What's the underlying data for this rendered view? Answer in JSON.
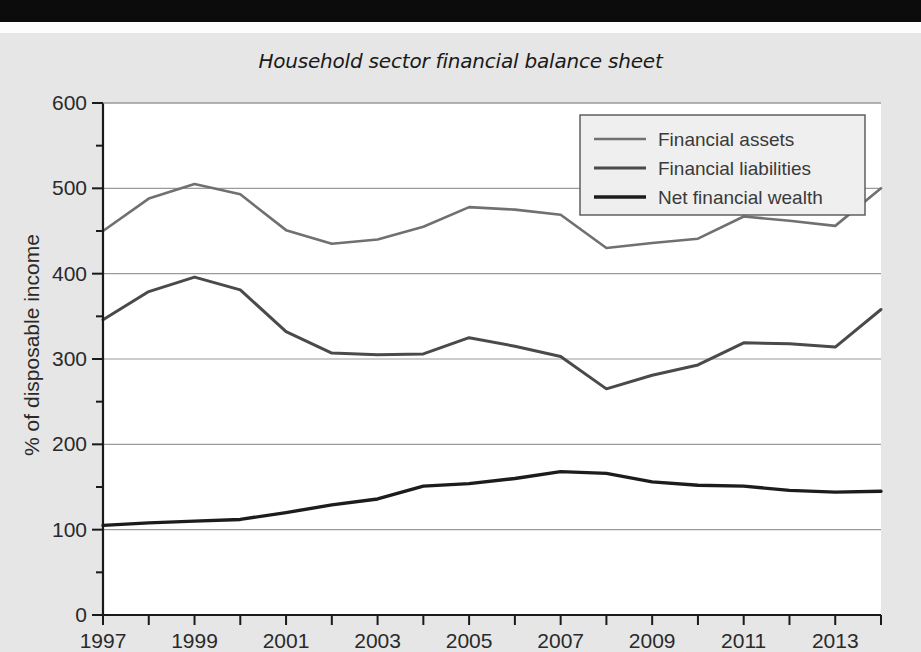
{
  "page": {
    "background_color": "#e6e6e6",
    "plot_background_color": "#ffffff"
  },
  "chart": {
    "title": "Household sector financial balance sheet",
    "y_axis_label": "% of disposable income"
  },
  "legend": {
    "items": [
      {
        "label": "Financial assets",
        "color": "#707070",
        "width": 2.6
      },
      {
        "label": "Financial liabilities",
        "color": "#4a4a4a",
        "width": 3.0
      },
      {
        "label": "Net financial wealth",
        "color": "#1c1c1c",
        "width": 3.4
      }
    ]
  },
  "chart_data": {
    "type": "line",
    "title": "Household sector financial balance sheet",
    "xlabel": "",
    "ylabel": "% of disposable income",
    "xlim": [
      1997,
      2014
    ],
    "ylim": [
      0,
      600
    ],
    "yticks": [
      0,
      100,
      200,
      300,
      400,
      500,
      600
    ],
    "yticks_minor": [
      50,
      150,
      250,
      350,
      450,
      550
    ],
    "xticks": [
      1997,
      1998,
      1999,
      2000,
      2001,
      2002,
      2003,
      2004,
      2005,
      2006,
      2007,
      2008,
      2009,
      2010,
      2011,
      2012,
      2013,
      2014
    ],
    "xtick_labels": [
      "1997",
      "",
      "1999",
      "",
      "2001",
      "",
      "2003",
      "",
      "2005",
      "",
      "2007",
      "",
      "2009",
      "",
      "2011",
      "",
      "2013",
      ""
    ],
    "grid": "horizontal",
    "legend_position": "top-right",
    "x": [
      1997,
      1998,
      1999,
      2000,
      2001,
      2002,
      2003,
      2004,
      2005,
      2006,
      2007,
      2008,
      2009,
      2010,
      2011,
      2012,
      2013,
      2014
    ],
    "series": [
      {
        "name": "Financial assets",
        "color": "#707070",
        "values": [
          450,
          488,
          505,
          493,
          451,
          435,
          440,
          455,
          478,
          475,
          469,
          430,
          436,
          441,
          467,
          462,
          456,
          500
        ]
      },
      {
        "name": "Financial liabilities",
        "color": "#4a4a4a",
        "values": [
          346,
          379,
          396,
          381,
          332,
          307,
          305,
          306,
          325,
          315,
          303,
          265,
          281,
          293,
          319,
          318,
          314,
          358
        ]
      },
      {
        "name": "Net financial wealth",
        "color": "#1c1c1c",
        "values": [
          105,
          108,
          110,
          112,
          120,
          129,
          136,
          151,
          154,
          160,
          168,
          166,
          156,
          152,
          151,
          146,
          144,
          145
        ]
      }
    ]
  }
}
